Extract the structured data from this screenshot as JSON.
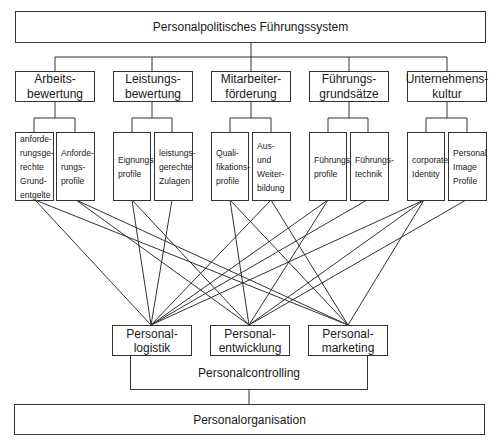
{
  "title": "Personalpolitisches Führungssystem",
  "categories": [
    {
      "label": "Arbeits-\nbewertung",
      "subs": [
        "anforde-\nrungsge-\nrechte\nGrund-\nentgelte",
        "Anforde-\nrungs-\nprofile"
      ]
    },
    {
      "label": "Leistungs-\nbewertung",
      "subs": [
        "Eignungs-\nprofile",
        "leistungs-\ngerechte\nZulagen"
      ]
    },
    {
      "label": "Mitarbeiter-\nförderung",
      "subs": [
        "Quali-\nfikations-\nprofile",
        "Aus-\nund\nWeiter-\nbildung"
      ]
    },
    {
      "label": "Führungs-\ngrundsätze",
      "subs": [
        "Führungs-\nprofile",
        "Führungs-\ntechnik"
      ]
    },
    {
      "label": "Unternehmens-\nkultur",
      "subs": [
        "corporate\nIdentity",
        "Personal\nImage\nProfile"
      ]
    }
  ],
  "functions": [
    {
      "label": "Personal-\nlogistik"
    },
    {
      "label": "Personal-\nentwicklung"
    },
    {
      "label": "Personal-\nmarketing"
    }
  ],
  "controlling": "Personalcontrolling",
  "organisation": "Personalorganisation",
  "connections": [
    {
      "from": "anforderungsgerechte Grundentgelte",
      "to": [
        "Personallogistik",
        "Personalmarketing"
      ]
    },
    {
      "from": "Anforderungsprofile",
      "to": [
        "Personalentwicklung",
        "Personalmarketing"
      ]
    },
    {
      "from": "Eignungsprofile",
      "to": [
        "Personallogistik",
        "Personalentwicklung"
      ]
    },
    {
      "from": "leistungsgerechte Zulagen",
      "to": [
        "Personallogistik"
      ]
    },
    {
      "from": "Qualifikationsprofile",
      "to": [
        "Personalentwicklung",
        "Personalmarketing"
      ]
    },
    {
      "from": "Aus- und Weiterbildung",
      "to": [
        "Personallogistik",
        "Personalmarketing"
      ]
    },
    {
      "from": "Führungsprofile",
      "to": [
        "Personallogistik",
        "Personalentwicklung"
      ]
    },
    {
      "from": "Führungstechnik",
      "to": [
        "Personallogistik"
      ]
    },
    {
      "from": "corporate Identity",
      "to": [
        "Personallogistik",
        "Personalentwicklung",
        "Personalmarketing"
      ]
    },
    {
      "from": "Personal Image Profile",
      "to": [
        "Personalentwicklung"
      ]
    }
  ]
}
